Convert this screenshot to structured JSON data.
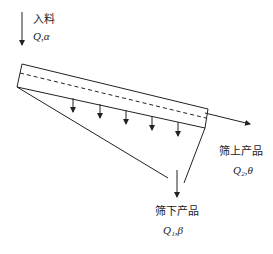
{
  "diagram": {
    "title": "",
    "feed": {
      "label": "入料",
      "symbol": "Q,α"
    },
    "overflow": {
      "label": "筛上产品",
      "symbol": "Q₂,θ"
    },
    "underflow": {
      "label": "筛下产品",
      "symbol": "Q₁,β"
    },
    "colors": {
      "line": "#222222",
      "background": "#ffffff"
    },
    "screen_deck": {
      "top_left": [
        22,
        64
      ],
      "top_right": [
        208,
        109
      ],
      "bottom_left": [
        17,
        87
      ],
      "bottom_right": [
        205,
        128
      ],
      "dashed_line": [
        [
          20,
          73
        ],
        [
          206,
          118
        ]
      ]
    },
    "passage_arrows_x": [
      73,
      100,
      126,
      152,
      178
    ]
  }
}
